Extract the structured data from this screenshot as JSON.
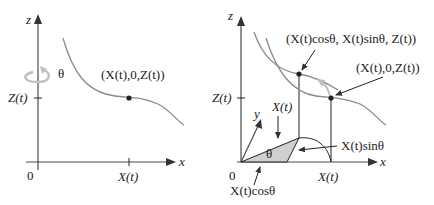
{
  "left_panel": {
    "axis_z_label": "z",
    "axis_x_label": "x",
    "origin_label": "0",
    "z_tick_label": "Z(t)",
    "x_tick_label": "X(t)",
    "rotation_label": "θ",
    "point_label": "(X(t),0,Z(t))"
  },
  "right_panel": {
    "axis_z_label": "z",
    "axis_x_label": "x",
    "axis_y_label": "y",
    "origin_label": "0",
    "z_tick_label": "Z(t)",
    "x_tick_label": "X(t)",
    "rotated_point_label": "(X(t)cosθ, X(t)sinθ, Z(t))",
    "point_label": "(X(t),0,Z(t))",
    "radius_label": "X(t)",
    "angle_label": "θ",
    "sin_label": "X(t)sinθ",
    "cos_label": "X(t)cosθ"
  },
  "colors": {
    "axis": "#4a4a4a",
    "curve": "#8a8a8a",
    "rotation_arrow": "#c0c0c0",
    "triangle_fill": "#d0d0d0",
    "text": "#222222"
  }
}
